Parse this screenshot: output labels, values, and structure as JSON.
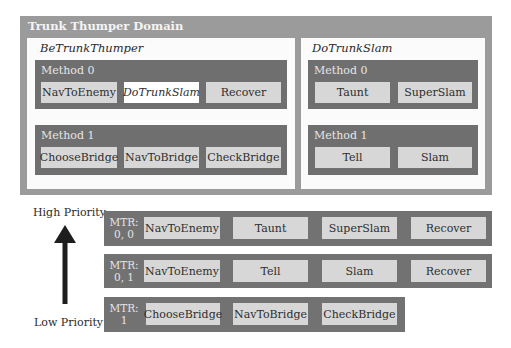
{
  "domain": {
    "title": "Trunk Thumper Domain"
  },
  "tasks": [
    {
      "name": "BeTrunkThumper",
      "methods": [
        {
          "label": "Method 0",
          "steps": [
            "NavToEnemy",
            "DoTrunkSlam",
            "Recover"
          ]
        },
        {
          "label": "Method 1",
          "steps": [
            "ChooseBridge",
            "NavToBridge",
            "CheckBridge"
          ]
        }
      ]
    },
    {
      "name": "DoTrunkSlam",
      "methods": [
        {
          "label": "Method 0",
          "steps": [
            "Taunt",
            "SuperSlam"
          ]
        },
        {
          "label": "Method 1",
          "steps": [
            "Tell",
            "Slam"
          ]
        }
      ]
    }
  ],
  "priority": {
    "high": "High Priority",
    "low": "Low Priority"
  },
  "mtr_rows": [
    {
      "mtr_line1": "MTR:",
      "mtr_line2": "0, 0",
      "steps": [
        "NavToEnemy",
        "Taunt",
        "SuperSlam",
        "Recover"
      ]
    },
    {
      "mtr_line1": "MTR:",
      "mtr_line2": "0, 1",
      "steps": [
        "NavToEnemy",
        "Tell",
        "Slam",
        "Recover"
      ]
    },
    {
      "mtr_line1": "MTR:",
      "mtr_line2": "1",
      "steps": [
        "ChooseBridge",
        "NavToBridge",
        "CheckBridge"
      ]
    }
  ],
  "colors": {
    "domain": "#9b9b9b",
    "method": "#6f6f6f",
    "step": "#d7d7d7",
    "compound_step": "#ffffff"
  }
}
